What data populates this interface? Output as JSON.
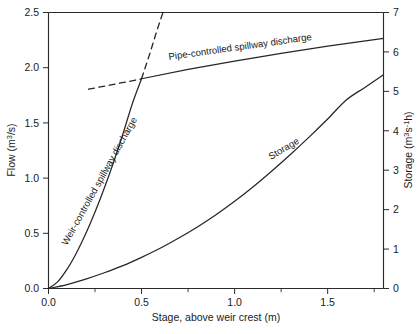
{
  "chart_data": {
    "type": "line",
    "title": "",
    "xlabel": "Stage, above weir crest (m)",
    "ylabel": "Flow (m3/s)",
    "ylabel_right": "Storage (m3s-1h)",
    "xlim": [
      0.0,
      1.8
    ],
    "ylim": [
      0.0,
      2.5
    ],
    "ylim_right": [
      0,
      7
    ],
    "grid": false,
    "legend": "inline-curve-labels",
    "xticks": [
      0.0,
      0.5,
      1.0,
      1.5
    ],
    "xtick_labels": [
      "0.0",
      "0.5",
      "1.0",
      "1.5"
    ],
    "xticks_minor": [
      0.25,
      0.75,
      1.25,
      1.75
    ],
    "yticks_left": [
      0.0,
      0.5,
      1.0,
      1.5,
      2.0,
      2.5
    ],
    "ytick_labels_left": [
      "0.0",
      "0.5",
      "1.0",
      "1.5",
      "2.0",
      "2.5"
    ],
    "yticks_right": [
      0,
      1,
      2,
      3,
      4,
      5,
      6,
      7
    ],
    "ytick_labels_right": [
      "0",
      "1",
      "2",
      "3",
      "4",
      "5",
      "6",
      "7"
    ],
    "series": [
      {
        "name": "Weir-controlled spillway discharge",
        "style": "solid",
        "axis": "left",
        "label_text": "Weir-controlled spillway discharge",
        "label_rotation": -61,
        "points": [
          [
            0.0,
            0.0
          ],
          [
            0.05,
            0.062
          ],
          [
            0.1,
            0.175
          ],
          [
            0.15,
            0.322
          ],
          [
            0.2,
            0.495
          ],
          [
            0.25,
            0.692
          ],
          [
            0.3,
            0.91
          ],
          [
            0.35,
            1.146
          ],
          [
            0.4,
            1.4
          ],
          [
            0.45,
            1.671
          ],
          [
            0.5,
            1.9
          ]
        ]
      },
      {
        "name": "Pipe-controlled spillway discharge",
        "style": "solid",
        "axis": "left",
        "label_text": "Pipe-controlled spillway discharge",
        "label_rotation": -7.5,
        "points": [
          [
            0.5,
            1.9
          ],
          [
            0.75,
            1.985
          ],
          [
            1.0,
            2.06
          ],
          [
            1.25,
            2.13
          ],
          [
            1.5,
            2.195
          ],
          [
            1.8,
            2.265
          ]
        ]
      },
      {
        "name": "Weir relation extension (dashed)",
        "style": "dashed",
        "axis": "left",
        "points": [
          [
            0.5,
            1.9
          ],
          [
            0.545,
            2.13
          ],
          [
            0.585,
            2.35
          ],
          [
            0.615,
            2.5
          ]
        ]
      },
      {
        "name": "Pipe relation extension (dashed)",
        "style": "dashed",
        "axis": "left",
        "points": [
          [
            0.215,
            1.805
          ],
          [
            0.33,
            1.843
          ],
          [
            0.44,
            1.878
          ],
          [
            0.5,
            1.9
          ]
        ]
      },
      {
        "name": "Storage",
        "style": "solid",
        "axis": "right",
        "label_text": "Storage",
        "label_rotation": -31,
        "points": [
          [
            0.0,
            0.0
          ],
          [
            0.1,
            0.1
          ],
          [
            0.2,
            0.24
          ],
          [
            0.3,
            0.4
          ],
          [
            0.4,
            0.58
          ],
          [
            0.5,
            0.79
          ],
          [
            0.6,
            1.02
          ],
          [
            0.7,
            1.28
          ],
          [
            0.8,
            1.56
          ],
          [
            0.9,
            1.87
          ],
          [
            1.0,
            2.21
          ],
          [
            1.1,
            2.58
          ],
          [
            1.2,
            2.98
          ],
          [
            1.3,
            3.4
          ],
          [
            1.4,
            3.84
          ],
          [
            1.5,
            4.3
          ],
          [
            1.6,
            4.78
          ],
          [
            1.7,
            5.1
          ],
          [
            1.8,
            5.42
          ]
        ]
      }
    ]
  },
  "axes": {
    "left_title_main": "Flow (m",
    "left_title_sup": "3",
    "left_title_tail": "/s)",
    "right_title_main": "Storage (m",
    "right_title_sup1": "3",
    "right_title_mid": "s",
    "right_title_sup2": "-1",
    "right_title_tail": "h)",
    "bottom_title": "Stage, above weir crest (m)"
  },
  "labels": {
    "weir": "Weir-controlled spillway discharge",
    "pipe": "Pipe-controlled spillway discharge",
    "storage": "Storage"
  },
  "caption": {
    "text": ""
  }
}
